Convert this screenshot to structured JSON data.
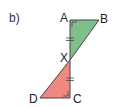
{
  "part_label": "b)",
  "colors": {
    "top_triangle_fill": "#7fbf8a",
    "bottom_triangle_fill": "#f08a80",
    "stroke": "#444444"
  },
  "vertices": {
    "A": {
      "label": "A",
      "x": 70,
      "y": 20
    },
    "B": {
      "label": "B",
      "x": 99,
      "y": 20
    },
    "X": {
      "label": "X",
      "x": 70,
      "y": 60
    },
    "D": {
      "label": "D",
      "x": 40,
      "y": 98
    },
    "C": {
      "label": "C",
      "x": 70,
      "y": 98
    }
  },
  "triangles": [
    {
      "name": "ABX",
      "vertices": [
        "A",
        "B",
        "X"
      ],
      "right_angle_at": "A"
    },
    {
      "name": "XDC",
      "vertices": [
        "X",
        "D",
        "C"
      ],
      "right_angle_at": "C"
    }
  ],
  "equal_marks": [
    "AX",
    "XC"
  ]
}
